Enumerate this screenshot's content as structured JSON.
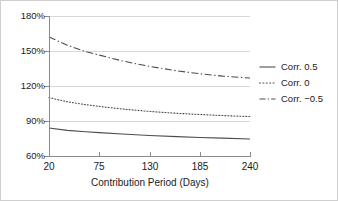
{
  "chart_data": {
    "type": "line",
    "title": "",
    "xlabel": "Contribution Period (Days)",
    "ylabel": "",
    "xlim": [
      20,
      240
    ],
    "ylim": [
      60,
      180
    ],
    "xticks": [
      20,
      75,
      130,
      185,
      240
    ],
    "xtick_labels": [
      "20",
      "75",
      "130",
      "185",
      "240"
    ],
    "yticks": [
      60,
      90,
      120,
      150,
      180
    ],
    "ytick_labels": [
      "60%",
      "90%",
      "120%",
      "150%",
      "180%"
    ],
    "grid": "horizontal",
    "legend_position": "right",
    "x": [
      20,
      40,
      60,
      75,
      100,
      130,
      160,
      185,
      210,
      240
    ],
    "series": [
      {
        "name": "Corr. 0.5",
        "style": "solid",
        "color": "#4d4d4d",
        "values": [
          84,
          82,
          80.8,
          80,
          78.8,
          77.6,
          76.6,
          75.9,
          75.3,
          74.6
        ]
      },
      {
        "name": "Corr. 0",
        "style": "dotted",
        "color": "#4d4d4d",
        "values": [
          110,
          106.5,
          104,
          102.5,
          100.3,
          98.2,
          96.6,
          95.6,
          94.7,
          93.8
        ]
      },
      {
        "name": "Corr. −0.5",
        "style": "dashdot",
        "color": "#4d4d4d",
        "values": [
          162,
          155,
          149.5,
          146.5,
          141.5,
          136.8,
          133,
          130.5,
          128.5,
          126.8
        ]
      }
    ]
  },
  "axes": {
    "y_labels": [
      "180%",
      "150%",
      "120%",
      "90%",
      "60%"
    ],
    "x_labels": [
      "20",
      "75",
      "130",
      "185",
      "240"
    ],
    "x_title": "Contribution Period (Days)"
  },
  "legend": {
    "items": [
      {
        "label": "Corr. 0.5",
        "style": "solid"
      },
      {
        "label": "Corr. 0",
        "style": "dotted"
      },
      {
        "label": "Corr. −0.5",
        "style": "dashdot"
      }
    ]
  },
  "colors": {
    "line": "#4d4d4d",
    "grid": "#d8d8d8",
    "axis": "#8a8a8a",
    "text": "#1a1a1a",
    "background": "#ffffff",
    "border": "#cfcfcf"
  }
}
